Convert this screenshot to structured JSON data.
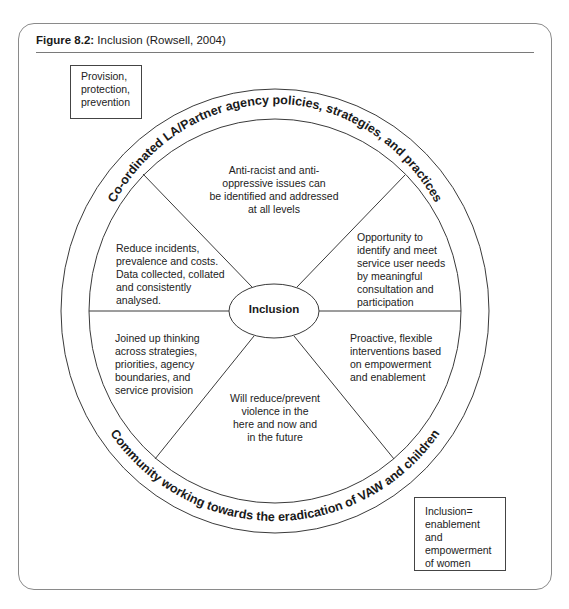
{
  "figure": {
    "label": "Figure 8.2:",
    "caption": " Inclusion (Rowsell, 2004)"
  },
  "corner_boxes": {
    "top_left": {
      "lines": [
        "Provision,",
        "protection,",
        "prevention"
      ]
    },
    "bottom_right": {
      "lines": [
        "Inclusion=",
        "enablement",
        "and",
        "empowerment",
        "of women"
      ]
    }
  },
  "wheel": {
    "center_label": "Inclusion",
    "outer_ring_top_text": "Co-ordinated LA/Partner agency policies, strategies, and practices",
    "outer_ring_bottom_text": "Community working towards the eradication of VAW and children",
    "segments": {
      "top": [
        "Anti-racist and anti-",
        "oppressive issues can",
        "be identified and addressed",
        "at all levels"
      ],
      "upper_right": [
        "Opportunity to",
        "identify and meet",
        "service user needs",
        "by meaningful",
        "consultation and",
        "participation"
      ],
      "lower_right": [
        "Proactive, flexible",
        "interventions based",
        "on empowerment",
        "and enablement"
      ],
      "bottom": [
        "Will reduce/prevent",
        "violence in the",
        "here and now and",
        "in the future"
      ],
      "lower_left": [
        "Joined up thinking",
        "across strategies,",
        "priorities, agency",
        "boundaries, and",
        "service provision"
      ],
      "upper_left": [
        "Reduce incidents,",
        "prevalence and costs.",
        "Data collected, collated",
        "and consistently",
        "analysed."
      ]
    }
  },
  "colors": {
    "line": "#3a3a3a",
    "frame": "#8a8a8a",
    "text": "#1a1a1a",
    "background": "#ffffff"
  }
}
